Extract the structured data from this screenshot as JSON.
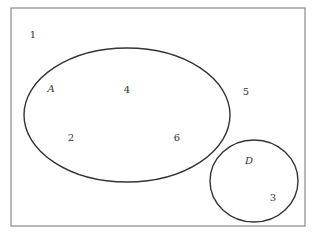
{
  "diagram": {
    "type": "venn",
    "universe": {
      "x": 11,
      "y": 8,
      "width": 294,
      "height": 218,
      "stroke": "#888888"
    },
    "sets": [
      {
        "name": "A",
        "shape": "ellipse",
        "cx": 127,
        "cy": 115,
        "rx": 103,
        "ry": 67,
        "label_x": 51,
        "label_y": 92,
        "stroke": "#333333"
      },
      {
        "name": "D",
        "shape": "ellipse",
        "cx": 254,
        "cy": 181,
        "rx": 44,
        "ry": 41,
        "label_x": 249,
        "label_y": 164,
        "stroke": "#333333"
      }
    ],
    "elements": [
      {
        "value": "1",
        "x": 33,
        "y": 38,
        "region": "outside"
      },
      {
        "value": "4",
        "x": 127,
        "y": 93,
        "region": "A"
      },
      {
        "value": "5",
        "x": 246,
        "y": 95,
        "region": "outside"
      },
      {
        "value": "2",
        "x": 71,
        "y": 141,
        "region": "A"
      },
      {
        "value": "6",
        "x": 177,
        "y": 141,
        "region": "A"
      },
      {
        "value": "3",
        "x": 273,
        "y": 201,
        "region": "D"
      }
    ]
  }
}
